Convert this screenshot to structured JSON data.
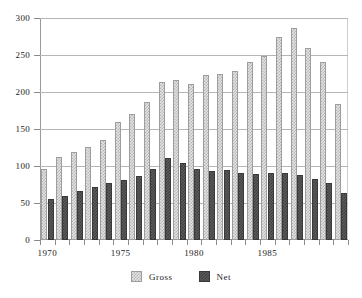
{
  "chart_data": {
    "type": "bar",
    "title": "",
    "subtitle": "",
    "xlabel": "",
    "ylabel": "",
    "ylim": [
      0,
      300
    ],
    "yticks": [
      0,
      50,
      100,
      150,
      200,
      250,
      300
    ],
    "ytick_labels": [
      "0",
      "50",
      "100",
      "150",
      "200",
      "250",
      "300"
    ],
    "grid": true,
    "grid_axis": "y",
    "legend_position": "bottom-center",
    "categories": [
      "1970",
      "1971",
      "1972",
      "1973",
      "1974",
      "1975",
      "1976",
      "1977",
      "1978",
      "1979",
      "1980",
      "1981",
      "1982",
      "1983",
      "1984",
      "1985",
      "1986",
      "1987",
      "1988",
      "1989"
    ],
    "xtick_labels": [
      "1970",
      "1975",
      "1980",
      "1985"
    ],
    "xtick_categories": [
      "1970",
      "1975",
      "1980",
      "1985"
    ],
    "series": [
      {
        "name": "Gross",
        "color": "#e2e2e2",
        "values": [
          96,
          112,
          119,
          126,
          135,
          160,
          170,
          186,
          214,
          216,
          211,
          223,
          225,
          228,
          240,
          249,
          275,
          287,
          260,
          240
        ]
      },
      {
        "name": "Net",
        "color": "#5b5b5b",
        "values": [
          55,
          60,
          66,
          71,
          77,
          81,
          86,
          96,
          111,
          104,
          96,
          93,
          95,
          91,
          89,
          90,
          91,
          88,
          83,
          77
        ]
      }
    ],
    "extra_final_gross": {
      "category": "1990",
      "gross": 184,
      "net": 63
    }
  },
  "legend": {
    "entries": [
      {
        "label": "Gross",
        "swatch": "gross-swatch"
      },
      {
        "label": "Net",
        "swatch": "net-swatch"
      }
    ]
  }
}
